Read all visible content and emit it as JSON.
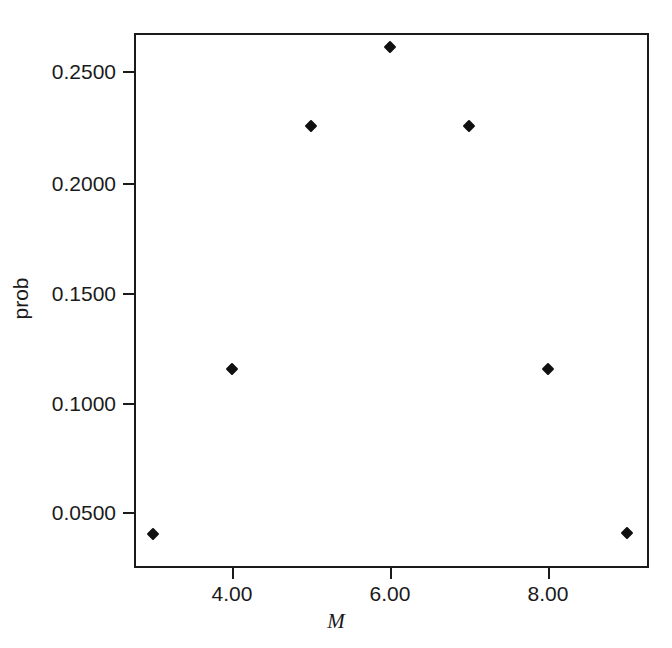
{
  "chart_data": {
    "type": "scatter",
    "title": "",
    "xlabel": "M",
    "ylabel": "prob",
    "x": [
      3,
      4,
      5,
      6,
      7,
      8,
      9
    ],
    "values": [
      0.04,
      0.115,
      0.225,
      0.261,
      0.225,
      0.115,
      0.0405
    ],
    "series": [
      {
        "name": "prob",
        "values": [
          0.04,
          0.115,
          0.225,
          0.261,
          0.225,
          0.115,
          0.0405
        ]
      }
    ],
    "xlim": [
      2.52,
      9.04
    ],
    "ylim": [
      0.0163,
      0.2713
    ],
    "xticks": [
      4,
      6,
      8
    ],
    "xticklabels": [
      "4.00",
      "6.00",
      "8.00"
    ],
    "yticks": [
      0.05,
      0.1,
      0.15,
      0.2,
      0.25
    ],
    "yticklabels": [
      "0.0500",
      "0.1000",
      "0.1500",
      "0.2000",
      "0.2500"
    ],
    "grid": false,
    "legend": null,
    "marker": "diamond",
    "marker_color": "#101010",
    "frame_color": "#1a1a1a",
    "background": "#ffffff"
  },
  "axis": {
    "y_title": "prob",
    "x_title": "M"
  },
  "caption": {
    "text": ""
  }
}
